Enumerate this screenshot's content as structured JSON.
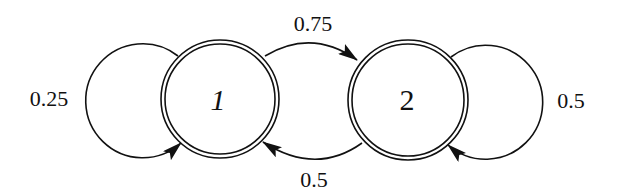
{
  "diagram": {
    "type": "markov-chain",
    "states": [
      {
        "id": "1",
        "label": "1",
        "italic": true
      },
      {
        "id": "2",
        "label": "2",
        "italic": false
      }
    ],
    "transitions": [
      {
        "from": "1",
        "to": "1",
        "label": "0.25"
      },
      {
        "from": "1",
        "to": "2",
        "label": "0.75"
      },
      {
        "from": "2",
        "to": "1",
        "label": "0.5"
      },
      {
        "from": "2",
        "to": "2",
        "label": "0.5"
      }
    ],
    "colors": {
      "stroke": "#111111",
      "background": "#ffffff"
    }
  }
}
